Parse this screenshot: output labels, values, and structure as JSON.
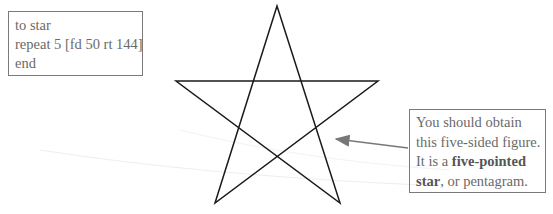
{
  "code": {
    "lines": [
      "to star",
      "repeat 5 [fd 50 rt 144]",
      "end"
    ]
  },
  "note": {
    "line1": "You should obtain",
    "line2": "this five-sided figure.",
    "line3_prefix": "It is a ",
    "line3_bold": "five-pointed",
    "line4_bold": "star",
    "line4_suffix": ", or pentagram."
  },
  "figure": {
    "shape": "pentagram",
    "stroke_color": "#1a1a1a",
    "arrow_color": "#777777"
  }
}
